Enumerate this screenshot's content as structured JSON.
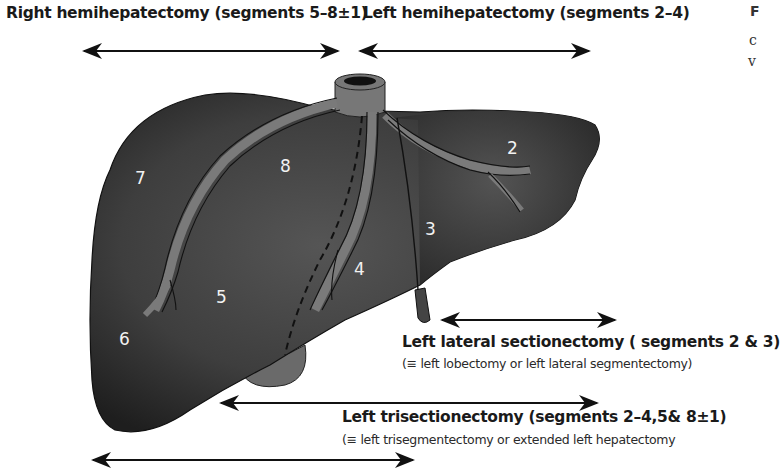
{
  "labels": {
    "right_hemi": "Right hemihepatectomy (segments 5–8±1)",
    "left_hemi": "Left hemihepatectomy (segments 2–4)",
    "left_lateral_title": "Left lateral sectionectomy ( segments 2 & 3)",
    "left_lateral_sub": "(≡ left lobectomy or left lateral segmentectomy)",
    "left_tri_title": "Left trisectionectomy (segments 2–4,5& 8±1)",
    "left_tri_sub": "(≡ left trisegmentectomy or extended left hepatectomy"
  },
  "edge_text": {
    "line1": "F",
    "line2": "c",
    "line3": "v"
  },
  "segments": {
    "s2": "2",
    "s3": "3",
    "s4": "4",
    "s5": "5",
    "s6": "6",
    "s7": "7",
    "s8": "8"
  },
  "colors": {
    "liver_dark": "#2b2b2b",
    "liver_mid": "#4a4a4a",
    "vessel": "#7a7a7a",
    "arrow": "#111111"
  }
}
